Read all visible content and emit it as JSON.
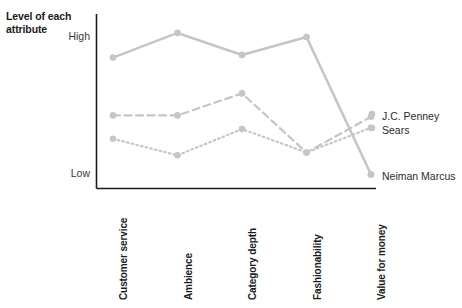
{
  "chart_data": {
    "type": "line",
    "title": "",
    "ylabel": "Level of each attribute",
    "xlabel": "",
    "categories": [
      "Customer service",
      "Ambience",
      "Category depth",
      "Fashionability",
      "Value for money"
    ],
    "ytick_labels": [
      "High",
      "Low"
    ],
    "ylim": [
      0,
      110
    ],
    "grid": false,
    "legend_position": "right",
    "series": [
      {
        "name": "Neiman Marcus",
        "style": "solid",
        "color": "#c6c6c6",
        "values": [
          85,
          103,
          87,
          100,
          0
        ]
      },
      {
        "name": "J.C. Penney",
        "style": "dashed",
        "color": "#c6c6c6",
        "values": [
          43,
          43,
          59,
          16,
          42
        ]
      },
      {
        "name": "Sears",
        "style": "dotted",
        "color": "#c6c6c6",
        "values": [
          26,
          14,
          33,
          16,
          34
        ]
      }
    ]
  },
  "axis": {
    "color": "#1b1b1b"
  }
}
